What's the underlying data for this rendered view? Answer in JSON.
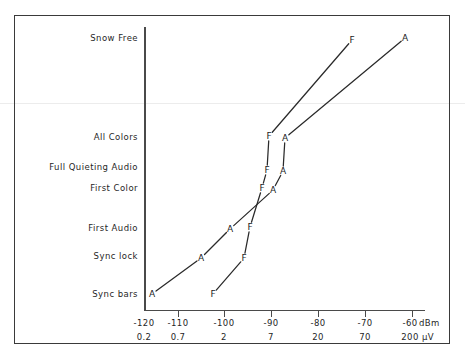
{
  "figure": {
    "title": "",
    "background_color": "#ffffff",
    "line_color": "#2a2a2a",
    "frame_color": "#3a3a3a"
  },
  "y_axis": {
    "label": "",
    "categories": [
      {
        "label": "Snow Free",
        "y": 38
      },
      {
        "label": "All Colors",
        "y": 137
      },
      {
        "label": "Full Quieting Audio",
        "y": 167
      },
      {
        "label": "First Color",
        "y": 188
      },
      {
        "label": "First Audio",
        "y": 228
      },
      {
        "label": "Sync lock",
        "y": 256
      },
      {
        "label": "Sync bars",
        "y": 294
      }
    ]
  },
  "x_axis": {
    "unit_primary": "dBm",
    "unit_secondary": "µV",
    "ticks": [
      {
        "dbm": "-120",
        "uv": "0.2",
        "x": 144
      },
      {
        "dbm": "-110",
        "uv": "0.7",
        "x": 178
      },
      {
        "dbm": "-100",
        "uv": "2",
        "x": 224
      },
      {
        "dbm": "-90",
        "uv": "7",
        "x": 271
      },
      {
        "dbm": "-80",
        "uv": "20",
        "x": 318
      },
      {
        "dbm": "-70",
        "uv": "70",
        "x": 365
      },
      {
        "dbm": "-60",
        "uv": "200",
        "x": 412
      }
    ]
  },
  "chart_data": {
    "type": "line",
    "title": "",
    "xlabel": "dBm / µV",
    "ylabel": "",
    "grid": false,
    "legend": "none",
    "categories": [
      "Sync bars",
      "Sync lock",
      "First Audio",
      "First Color",
      "Full Quieting Audio",
      "All Colors",
      "Snow Free"
    ],
    "x_tick_labels_dbm": [
      "-120",
      "-110",
      "-100",
      "-90",
      "-80",
      "-70",
      "-60"
    ],
    "x_tick_labels_uv": [
      "0.2",
      "0.7",
      "2",
      "7",
      "20",
      "70",
      "200"
    ],
    "xlim_dbm": [
      -122,
      -57
    ],
    "series": [
      {
        "name": "A",
        "marker": "A",
        "points": [
          {
            "label": "A",
            "category": "Sync bars",
            "dbm": -118,
            "x": 152,
            "y": 294
          },
          {
            "label": "A",
            "category": "Sync lock",
            "dbm": -107,
            "x": 201,
            "y": 258
          },
          {
            "label": "A",
            "category": "First Audio",
            "dbm": -101,
            "x": 230,
            "y": 229
          },
          {
            "label": "A",
            "category": "First Color",
            "dbm": -88,
            "x": 273,
            "y": 190
          },
          {
            "label": "A",
            "category": "Full Quieting Audio",
            "dbm": -86,
            "x": 283,
            "y": 171
          },
          {
            "label": "A",
            "category": "All Colors",
            "dbm": -86,
            "x": 285,
            "y": 138
          },
          {
            "label": "A",
            "category": "Snow Free",
            "dbm": -61,
            "x": 405,
            "y": 38
          }
        ]
      },
      {
        "name": "F",
        "marker": "F",
        "points": [
          {
            "label": "F",
            "category": "Sync bars",
            "dbm": -105,
            "x": 213,
            "y": 294
          },
          {
            "label": "F",
            "category": "Sync lock",
            "dbm": -100,
            "x": 244,
            "y": 258
          },
          {
            "label": "F",
            "category": "First Audio",
            "dbm": -96,
            "x": 250,
            "y": 227
          },
          {
            "label": "F",
            "category": "First Color",
            "dbm": -90,
            "x": 262,
            "y": 188
          },
          {
            "label": "F",
            "category": "Full Quieting Audio",
            "dbm": -89,
            "x": 267,
            "y": 170
          },
          {
            "label": "F",
            "category": "All Colors",
            "dbm": -88,
            "x": 269,
            "y": 136
          },
          {
            "label": "F",
            "category": "Snow Free",
            "dbm": -71,
            "x": 352,
            "y": 40
          }
        ]
      }
    ]
  }
}
